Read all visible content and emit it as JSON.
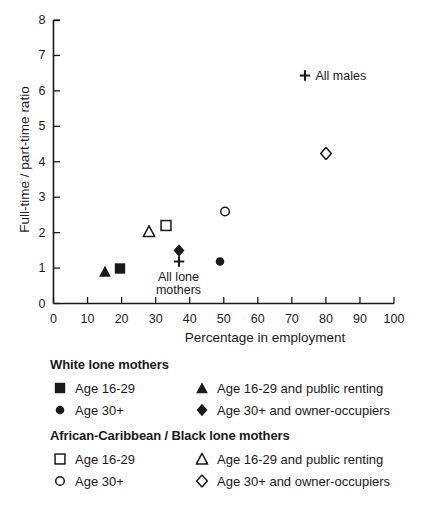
{
  "chart_data": {
    "type": "scatter",
    "title": "",
    "xlabel": "Percentage in employment",
    "ylabel": "Full-time / part-time ratio",
    "xlim": [
      0,
      100
    ],
    "ylim": [
      0,
      8
    ],
    "xticks": [
      "0",
      "10",
      "20",
      "30",
      "40",
      "50",
      "60",
      "70",
      "80",
      "90",
      "100"
    ],
    "yticks": [
      "0",
      "1",
      "2",
      "3",
      "4",
      "5",
      "6",
      "7",
      "8"
    ],
    "grid": false,
    "legend_position": "below",
    "points": [
      {
        "name": "white-age-16-29-public-renting",
        "marker": "filled-triangle",
        "x": 15.0,
        "y": 0.85,
        "label": ""
      },
      {
        "name": "white-age-16-29",
        "marker": "filled-square",
        "x": 19.5,
        "y": 0.95,
        "label": ""
      },
      {
        "name": "black-age-16-29-public-renting",
        "marker": "open-triangle",
        "x": 28.0,
        "y": 2.0,
        "label": ""
      },
      {
        "name": "black-age-16-29",
        "marker": "open-square",
        "x": 33.0,
        "y": 2.15,
        "label": ""
      },
      {
        "name": "white-age-30-owner-occupiers",
        "marker": "filled-diamond",
        "x": 37.0,
        "y": 1.45,
        "label": ""
      },
      {
        "name": "all-lone-mothers",
        "marker": "plus",
        "x": 37.0,
        "y": 1.15,
        "label": "All lone\nmothers"
      },
      {
        "name": "white-age-30",
        "marker": "filled-circle",
        "x": 49.0,
        "y": 1.15,
        "label": ""
      },
      {
        "name": "black-age-30",
        "marker": "open-circle",
        "x": 50.5,
        "y": 2.55,
        "label": ""
      },
      {
        "name": "black-age-30-owner-occupiers",
        "marker": "open-diamond",
        "x": 80.0,
        "y": 4.2,
        "label": ""
      },
      {
        "name": "all-males",
        "marker": "plus",
        "x": 74.0,
        "y": 6.4,
        "label": "All males"
      }
    ],
    "annotations": [
      {
        "name": "all-males-annotation",
        "text": "All males"
      },
      {
        "name": "all-lone-mothers-annotation",
        "text": "All lone mothers"
      }
    ]
  },
  "axes": {
    "y_title": "Full-time / part-time ratio",
    "x_title": "Percentage in employment",
    "x_tick_labels": [
      "0",
      "10",
      "20",
      "30",
      "40",
      "50",
      "60",
      "70",
      "80",
      "90",
      "100"
    ],
    "y_tick_labels": [
      "0",
      "1",
      "2",
      "3",
      "4",
      "5",
      "6",
      "7",
      "8"
    ]
  },
  "point_labels": {
    "all_males": "All males",
    "all_lone_mothers_line1": "All lone",
    "all_lone_mothers_line2": "mothers"
  },
  "legend": {
    "groups": [
      {
        "name": "white-lone-mothers",
        "heading": "White lone mothers",
        "rows": [
          {
            "left": {
              "marker": "filled-square",
              "label": "Age 16-29"
            },
            "right": {
              "marker": "filled-triangle",
              "label": "Age 16-29 and public renting"
            }
          },
          {
            "left": {
              "marker": "filled-circle",
              "label": "Age 30+"
            },
            "right": {
              "marker": "filled-diamond",
              "label": "Age 30+ and owner-occupiers"
            }
          }
        ]
      },
      {
        "name": "african-caribbean-black-lone-mothers",
        "heading": "African-Caribbean / Black lone mothers",
        "rows": [
          {
            "left": {
              "marker": "open-square",
              "label": "Age 16-29"
            },
            "right": {
              "marker": "open-triangle",
              "label": "Age 16-29 and public renting"
            }
          },
          {
            "left": {
              "marker": "open-circle",
              "label": "Age 30+"
            },
            "right": {
              "marker": "open-diamond",
              "label": "Age 30+ and owner-occupiers"
            }
          }
        ]
      }
    ]
  },
  "colors": {
    "ink": "#1a1a1a",
    "background": "#ffffff"
  }
}
